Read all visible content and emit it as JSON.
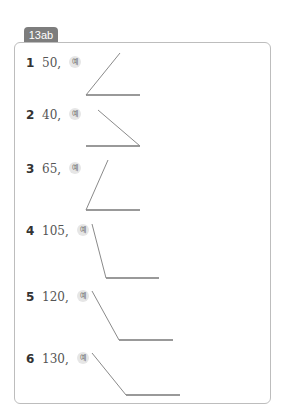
{
  "section": {
    "label": "13ab"
  },
  "example_marker": "예",
  "items": [
    {
      "number": "1",
      "value": "50,",
      "angle_deg": 50
    },
    {
      "number": "2",
      "value": "40,",
      "angle_deg": 40
    },
    {
      "number": "3",
      "value": "65,",
      "angle_deg": 65
    },
    {
      "number": "4",
      "value": "105,",
      "angle_deg": 105
    },
    {
      "number": "5",
      "value": "120,",
      "angle_deg": 120
    },
    {
      "number": "6",
      "value": "130,",
      "angle_deg": 130
    }
  ],
  "colors": {
    "tab_bg": "#7d7d7d",
    "border": "#bdbdbd",
    "line": "#8a8a8a"
  }
}
